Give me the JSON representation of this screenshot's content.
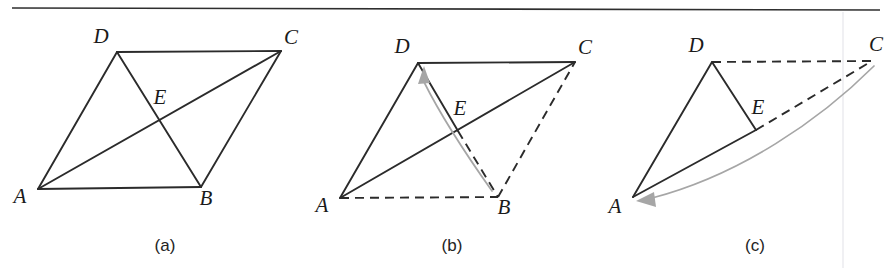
{
  "figure": {
    "background_color": "#ffffff",
    "ink_color": "#2b2b2b",
    "motion_color": "#a6a6a6",
    "top_rule": {
      "x1": 12,
      "y1": 8,
      "x2": 880,
      "y2": 10
    },
    "scan_artifact_line": {
      "x": 843,
      "y1": 12,
      "y2": 268
    },
    "panels": [
      {
        "id": "a",
        "caption": "(a)",
        "caption_x": 165,
        "caption_y": 251,
        "description": "Parallelogram ABCD with both diagonals AC and BD drawn, meeting at E",
        "points": {
          "A": {
            "x": 38,
            "y": 189,
            "label": "A",
            "label_x": 20,
            "label_y": 203
          },
          "B": {
            "x": 201,
            "y": 187,
            "label": "B",
            "label_x": 206,
            "label_y": 205
          },
          "C": {
            "x": 281,
            "y": 51,
            "label": "C",
            "label_x": 291,
            "label_y": 44
          },
          "D": {
            "x": 117,
            "y": 52,
            "label": "D",
            "label_x": 101,
            "label_y": 43
          },
          "E": {
            "x": 160,
            "y": 120,
            "label": "E",
            "label_x": 160,
            "label_y": 104
          }
        },
        "edges": [
          {
            "from": "A",
            "to": "B",
            "style": "solid"
          },
          {
            "from": "B",
            "to": "C",
            "style": "solid"
          },
          {
            "from": "C",
            "to": "D",
            "style": "solid"
          },
          {
            "from": "D",
            "to": "A",
            "style": "solid"
          },
          {
            "from": "A",
            "to": "C",
            "style": "solid"
          },
          {
            "from": "D",
            "to": "B",
            "style": "solid"
          }
        ],
        "motion_arrows": []
      },
      {
        "id": "b",
        "caption": "(b)",
        "caption_x": 452,
        "caption_y": 251,
        "description": "Triangle ACD solid with segment DE solid; AB, EB and BC dashed; gray curved arrow sweeps B onto D",
        "points": {
          "A": {
            "x": 340,
            "y": 198,
            "label": "A",
            "label_x": 322,
            "label_y": 212
          },
          "B": {
            "x": 498,
            "y": 197,
            "label": "B",
            "label_x": 504,
            "label_y": 214
          },
          "C": {
            "x": 575,
            "y": 62,
            "label": "C",
            "label_x": 585,
            "label_y": 54
          },
          "D": {
            "x": 418,
            "y": 63,
            "label": "D",
            "label_x": 402,
            "label_y": 53
          },
          "E": {
            "x": 458,
            "y": 131,
            "label": "E",
            "label_x": 460,
            "label_y": 115
          }
        },
        "edges": [
          {
            "from": "A",
            "to": "D",
            "style": "solid"
          },
          {
            "from": "D",
            "to": "C",
            "style": "solid"
          },
          {
            "from": "A",
            "to": "C",
            "style": "solid"
          },
          {
            "from": "D",
            "to": "E",
            "style": "solid"
          },
          {
            "from": "E",
            "to": "B",
            "style": "dashed"
          },
          {
            "from": "A",
            "to": "B",
            "style": "dashed"
          },
          {
            "from": "B",
            "to": "C",
            "style": "dashed"
          }
        ],
        "motion_arrows": [
          {
            "name": "fold-b-onto-d",
            "from": "B",
            "to": "D",
            "path": "M 492 191 C 470 160 443 120 424 82",
            "head_points": "424,66 418,84 430,83"
          }
        ]
      },
      {
        "id": "c",
        "caption": "(c)",
        "caption_x": 755,
        "caption_y": 251,
        "description": "Triangle ADE solid; DC and EC dashed; gray curved arrow sweeps C onto A",
        "points": {
          "A": {
            "x": 633,
            "y": 197,
            "label": "A",
            "label_x": 615,
            "label_y": 213
          },
          "C": {
            "x": 872,
            "y": 61,
            "label": "C",
            "label_x": 876,
            "label_y": 51
          },
          "D": {
            "x": 712,
            "y": 62,
            "label": "D",
            "label_x": 696,
            "label_y": 52
          },
          "E": {
            "x": 756,
            "y": 130,
            "label": "E",
            "label_x": 758,
            "label_y": 114
          }
        },
        "edges": [
          {
            "from": "A",
            "to": "D",
            "style": "solid"
          },
          {
            "from": "D",
            "to": "E",
            "style": "solid"
          },
          {
            "from": "A",
            "to": "E",
            "style": "solid"
          },
          {
            "from": "D",
            "to": "C",
            "style": "dashed"
          },
          {
            "from": "E",
            "to": "C",
            "style": "dashed"
          }
        ],
        "motion_arrows": [
          {
            "name": "fold-c-onto-a",
            "from": "C",
            "to": "A",
            "path": "M 874 66 C 820 120 740 175 652 198",
            "head_points": "636,201 656,207 654,192"
          }
        ]
      }
    ]
  }
}
